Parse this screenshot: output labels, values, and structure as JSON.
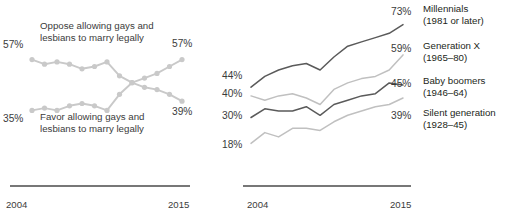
{
  "chart_data": [
    {
      "id": "overall-support",
      "type": "line",
      "title": "",
      "xlabel": "",
      "ylabel": "",
      "xlim": [
        2004,
        2015
      ],
      "ylim": [
        30,
        62
      ],
      "grid": false,
      "legend_position": "inline-annotation",
      "x_tick_labels": [
        "2004",
        "2015"
      ],
      "annotations": [
        "Oppose allowing gays and lesbians to marry legally",
        "Favor allowing gays and lesbians to marry legally"
      ],
      "endpoint_labels": {
        "oppose_start": "57%",
        "oppose_end": "39%",
        "favor_start": "35%",
        "favor_end": "57%"
      },
      "x": [
        2004,
        2005,
        2006,
        2007,
        2008,
        2009,
        2010,
        2011,
        2012,
        2013,
        2014,
        2015
      ],
      "series": [
        {
          "name": "Oppose allowing gays and lesbians to marry legally",
          "color": "#c9c9c9",
          "marker": "circle",
          "values": [
            57,
            55,
            56,
            55,
            53,
            54,
            56,
            50,
            47,
            45,
            44,
            42,
            39
          ]
        },
        {
          "name": "Favor allowing gays and lesbians to marry legally",
          "color": "#c9c9c9",
          "marker": "circle",
          "values": [
            35,
            36,
            35,
            37,
            38,
            37,
            35,
            42,
            47,
            49,
            51,
            54,
            57
          ]
        }
      ]
    },
    {
      "id": "support-by-generation",
      "type": "line",
      "title": "",
      "xlabel": "",
      "ylabel": "",
      "xlim": [
        2004,
        2015
      ],
      "ylim": [
        14,
        77
      ],
      "grid": false,
      "legend_position": "right",
      "x_tick_labels": [
        "2004",
        "2015"
      ],
      "x": [
        2004,
        2005,
        2006,
        2007,
        2008,
        2009,
        2010,
        2011,
        2012,
        2013,
        2014,
        2015
      ],
      "series": [
        {
          "name": "Millennials",
          "years": "(1981 or later)",
          "color": "#5a5a5a",
          "start_label": "44%",
          "end_label": "73%",
          "values": [
            44,
            49,
            52,
            54,
            55,
            52,
            58,
            63,
            65,
            67,
            69,
            73
          ]
        },
        {
          "name": "Generation X",
          "years": "(1965–80)",
          "color": "#c0c0c0",
          "start_label": "40%",
          "end_label": "59%",
          "values": [
            40,
            38,
            40,
            41,
            39,
            36,
            43,
            46,
            48,
            49,
            52,
            59
          ]
        },
        {
          "name": "Baby boomers",
          "years": "(1946–64)",
          "color": "#5a5a5a",
          "start_label": "30%",
          "end_label": "45%",
          "values": [
            30,
            34,
            33,
            33,
            35,
            31,
            36,
            38,
            40,
            41,
            46,
            45
          ]
        },
        {
          "name": "Silent generation",
          "years": "(1928–45)",
          "color": "#c0c0c0",
          "start_label": "18%",
          "end_label": "39%",
          "values": [
            18,
            23,
            21,
            25,
            25,
            24,
            28,
            31,
            33,
            35,
            36,
            39
          ]
        }
      ]
    }
  ],
  "left_chart": {
    "annotation_oppose_line1": "Oppose allowing gays and",
    "annotation_oppose_line2": "lesbians to marry legally",
    "annotation_favor_line1": "Favor allowing gays and",
    "annotation_favor_line2": "lesbians to marry legally",
    "pct_oppose_start": "57%",
    "pct_oppose_end": "39%",
    "pct_favor_start": "35%",
    "pct_favor_end": "57%",
    "axis_year_start": "2004",
    "axis_year_end": "2015"
  },
  "right_chart": {
    "pct_millennials_start": "44%",
    "pct_genx_start": "40%",
    "pct_boomers_start": "30%",
    "pct_silent_start": "18%",
    "pct_millennials_end": "73%",
    "pct_genx_end": "59%",
    "pct_boomers_end": "45%",
    "pct_silent_end": "39%",
    "legend": [
      {
        "name": "Millennials",
        "years": "(1981 or later)"
      },
      {
        "name": "Generation X",
        "years": "(1965–80)"
      },
      {
        "name": "Baby boomers",
        "years": "(1946–64)"
      },
      {
        "name": "Silent generation",
        "years": "(1928–45)"
      }
    ],
    "axis_year_start": "2004",
    "axis_year_end": "2015"
  },
  "colors": {
    "light_line": "#c9c9c9",
    "dark_line": "#5a5a5a",
    "axis": "#4a4a4a",
    "text": "#3b3b3b"
  }
}
